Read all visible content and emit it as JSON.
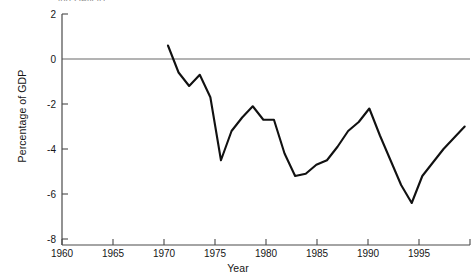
{
  "figure": {
    "clipped_top_text": "ing Deficit)",
    "ylabel": "Percentage of GDP",
    "xlabel": "Year"
  },
  "colors": {
    "line": "#111111",
    "axis": "#555555",
    "zero_line": "#9a9a9a",
    "background": "#ffffff",
    "text": "#161616"
  },
  "chart_data": {
    "type": "line",
    "title": "",
    "xlabel": "Year",
    "ylabel": "Percentage of GDP",
    "xlim": [
      1960,
      1998.5
    ],
    "ylim": [
      -8,
      2
    ],
    "xticks": [
      1960,
      1965,
      1970,
      1975,
      1980,
      1985,
      1990,
      1995
    ],
    "xtick_labels": [
      "1960",
      "1965",
      "1970",
      "1975",
      "1980",
      "1985",
      "1990",
      "1995"
    ],
    "yticks": [
      2,
      0,
      -2,
      -4,
      -6,
      -8
    ],
    "ytick_labels": [
      "2",
      "0",
      "-2",
      "-4",
      "-6",
      "-8"
    ],
    "grid": false,
    "zero_reference_line": 0,
    "legend": null,
    "series": [
      {
        "name": "Federal budget surplus/deficit",
        "x": [
          1970,
          1971,
          1972,
          1973,
          1974,
          1975,
          1976,
          1977,
          1978,
          1979,
          1980,
          1981,
          1982,
          1983,
          1984,
          1985,
          1986,
          1987,
          1988,
          1989,
          1990,
          1991,
          1992,
          1993,
          1994,
          1995,
          1996,
          1997,
          1998
        ],
        "values": [
          0.6,
          -0.6,
          -1.2,
          -0.7,
          -1.7,
          -4.5,
          -3.2,
          -2.6,
          -2.1,
          -2.7,
          -2.7,
          -4.2,
          -5.2,
          -5.1,
          -4.7,
          -4.5,
          -3.9,
          -3.2,
          -2.8,
          -2.2,
          -3.4,
          -4.5,
          -5.6,
          -6.4,
          -5.2,
          -4.6,
          -4.0,
          -3.5,
          -3.0
        ]
      }
    ]
  }
}
